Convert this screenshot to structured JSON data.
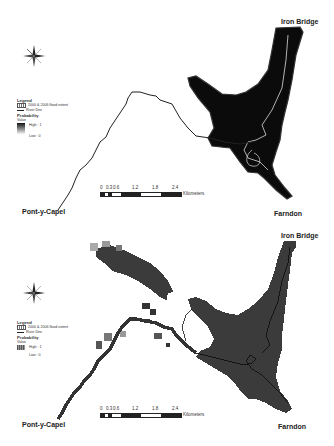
{
  "figure": {
    "panels": [
      {
        "id": "top",
        "style": "continuous-probability",
        "places": {
          "north": "Iron Bridge",
          "south": "Farndon",
          "west": "Pont-y-Capel"
        },
        "legend": {
          "title": "Legend",
          "flood_extent": "2000 & 2006 flood extent",
          "river": "River Dee",
          "probability": "Probability",
          "value": "Value",
          "high": "High : 1",
          "low": "Low : 0"
        },
        "scale_bar": {
          "ticks": [
            "0",
            "0.3",
            "0.6",
            "1.2",
            "1.8",
            "2.4"
          ],
          "unit": "Kilometers"
        }
      },
      {
        "id": "bottom",
        "style": "gridded-probability",
        "places": {
          "north": "Iron Bridge",
          "south": "Farndon",
          "west": "Pont-y-Capel"
        },
        "legend": {
          "title": "Legend",
          "flood_extent": "2000 & 2006 flood extent",
          "river": "River Dee",
          "probability": "Probability",
          "value": "Value",
          "high": "High : 1",
          "low": "Low : 0"
        },
        "scale_bar": {
          "ticks": [
            "0",
            "0.3",
            "0.6",
            "1.2",
            "1.8",
            "2.4"
          ],
          "unit": "Kilometers"
        }
      }
    ],
    "icons": {
      "north_arrow": "compass-rose-icon"
    },
    "colors": {
      "flood_high": "#0a0a0a",
      "flood_grid": "#3a3a3a",
      "river_line": "#222222",
      "background": "#ffffff"
    }
  }
}
